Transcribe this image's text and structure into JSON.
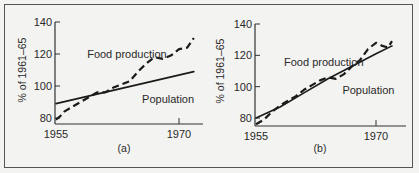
{
  "figure": {
    "panels": [
      "(a)",
      "(b)"
    ]
  },
  "chart_data": [
    {
      "type": "line",
      "panel_label": "(a)",
      "title": "",
      "xlabel": "",
      "ylabel": "% of 1961–65",
      "xlim": [
        1955,
        1972
      ],
      "ylim": [
        78,
        140
      ],
      "xticks": [
        1955,
        1970
      ],
      "yticks": [
        80,
        100,
        120,
        140
      ],
      "grid": false,
      "legend": "inline labels",
      "series": [
        {
          "name": "Food production",
          "style": "dashed",
          "x": [
            1955,
            1955.5,
            1956,
            1957,
            1958,
            1959,
            1960,
            1961,
            1962,
            1963,
            1964,
            1965,
            1966,
            1967,
            1968,
            1969,
            1970,
            1971,
            1971.8
          ],
          "y": [
            79,
            81,
            84,
            87,
            90,
            93,
            96,
            96,
            99,
            101,
            103,
            109,
            114,
            118,
            117,
            119,
            123,
            124,
            130
          ]
        },
        {
          "name": "Population",
          "style": "solid",
          "x": [
            1955,
            1971.8
          ],
          "y": [
            89,
            109
          ]
        }
      ],
      "annotations": [
        {
          "text": "Food production",
          "x": 1958.8,
          "y": 120
        },
        {
          "text": "Population",
          "x": 1965.5,
          "y": 92
        }
      ]
    },
    {
      "type": "line",
      "panel_label": "(b)",
      "title": "",
      "xlabel": "",
      "ylabel": "% of 1961–65",
      "xlim": [
        1955,
        1972.5
      ],
      "ylim": [
        76,
        140
      ],
      "xticks": [
        1955,
        1970
      ],
      "yticks": [
        80,
        100,
        120,
        140
      ],
      "grid": false,
      "legend": "inline labels",
      "series": [
        {
          "name": "Food production",
          "style": "dashed",
          "x": [
            1955,
            1956,
            1957,
            1958,
            1959,
            1960,
            1961,
            1962,
            1963,
            1964,
            1965,
            1966,
            1967,
            1968,
            1969,
            1970,
            1970.8,
            1971.5,
            1972
          ],
          "y": [
            76,
            79,
            84,
            88,
            91,
            94,
            98,
            101,
            104,
            106,
            105,
            108,
            113,
            117,
            124,
            128,
            126,
            125,
            129
          ]
        },
        {
          "name": "Population",
          "style": "solid",
          "x": [
            1955,
            1958,
            1961,
            1964,
            1967,
            1970,
            1972
          ],
          "y": [
            80,
            87,
            96,
            105,
            113,
            121,
            126
          ]
        }
      ],
      "annotations": [
        {
          "text": "Food production",
          "x": 1958.5,
          "y": 116
        },
        {
          "text": "Population",
          "x": 1965.8,
          "y": 98
        }
      ]
    }
  ]
}
